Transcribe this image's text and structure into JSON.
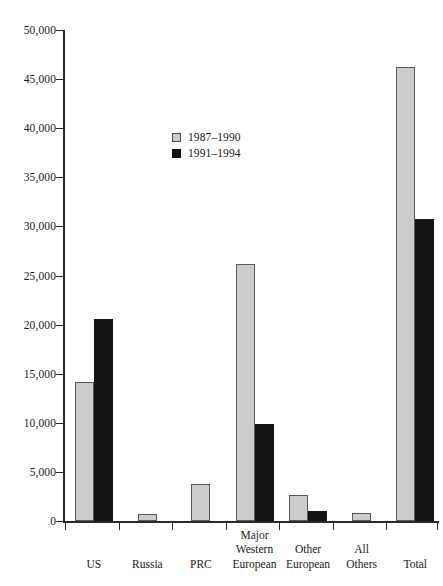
{
  "chart_data": {
    "type": "bar",
    "title": "",
    "xlabel": "",
    "ylabel": "",
    "ylim": [
      0,
      50000
    ],
    "ytick_step": 5000,
    "grid": false,
    "legend_position": "upper-center-left",
    "categories": [
      "US",
      "Russia",
      "PRC",
      "Major Western European",
      "Other European",
      "All Others",
      "Total"
    ],
    "category_lines": [
      [
        "US"
      ],
      [
        "Russia"
      ],
      [
        "PRC"
      ],
      [
        "Major",
        "Western",
        "European"
      ],
      [
        "Other",
        "European"
      ],
      [
        "All",
        "Others"
      ],
      [
        "Total"
      ]
    ],
    "ytick_labels": [
      "0",
      "5,000",
      "10,000",
      "15,000",
      "20,000",
      "25,000",
      "30,000",
      "35,000",
      "40,000",
      "45,000",
      "50,000"
    ],
    "ytick_values": [
      0,
      5000,
      10000,
      15000,
      20000,
      25000,
      30000,
      35000,
      40000,
      45000,
      50000
    ],
    "series": [
      {
        "name": "1987–1990",
        "color": "#cccccc",
        "values": [
          14200,
          700,
          3800,
          26200,
          2600,
          800,
          46200
        ]
      },
      {
        "name": "1991–1994",
        "color": "#141414",
        "values": [
          20600,
          0,
          0,
          9900,
          1000,
          0,
          30800
        ]
      }
    ]
  },
  "legend": {
    "items": [
      {
        "label": "1987–1990",
        "swatch": "light"
      },
      {
        "label": "1991–1994",
        "swatch": "dark"
      }
    ]
  },
  "colors": {
    "series_1987_1990": "#cccccc",
    "series_1991_1994": "#141414",
    "axis": "#2b2b2b",
    "background": "#ffffff"
  }
}
